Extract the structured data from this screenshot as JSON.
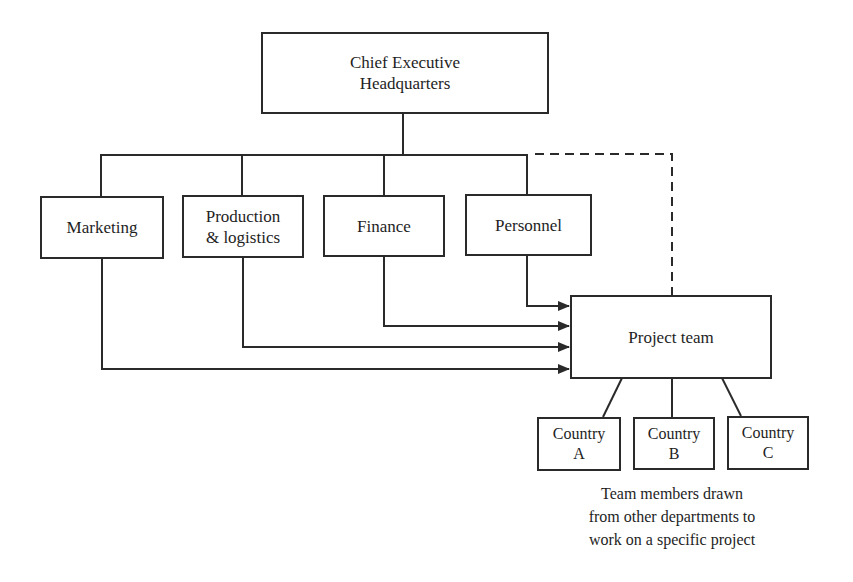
{
  "diagram": {
    "type": "organisation-structure",
    "headquarters": {
      "line1": "Chief Executive",
      "line2": "Headquarters"
    },
    "departments": [
      {
        "line1": "Marketing",
        "line2": ""
      },
      {
        "line1": "Production",
        "line2": "& logistics"
      },
      {
        "line1": "Finance",
        "line2": ""
      },
      {
        "line1": "Personnel",
        "line2": ""
      }
    ],
    "project_team": {
      "label": "Project team"
    },
    "countries": [
      {
        "line1": "Country",
        "line2": "A"
      },
      {
        "line1": "Country",
        "line2": "B"
      },
      {
        "line1": "Country",
        "line2": "C"
      }
    ],
    "caption": {
      "line1": "Team members drawn",
      "line2": "from other departments to",
      "line3": "work on a specific project"
    },
    "colors": {
      "line": "#2a2a2a",
      "text": "#1e1e1e",
      "background": "#ffffff"
    }
  }
}
